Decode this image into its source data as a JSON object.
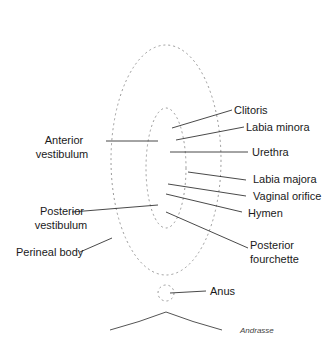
{
  "diagram": {
    "type": "labeled anatomical line drawing",
    "labels_right": [
      {
        "text": "Clitoris"
      },
      {
        "text": "Labia minora"
      },
      {
        "text": "Urethra"
      },
      {
        "text": "Labia majora"
      },
      {
        "text": "Vaginal orifice"
      },
      {
        "text": "Hymen"
      },
      {
        "text": "Posterior",
        "text2": "fourchette"
      },
      {
        "text": "Anus"
      }
    ],
    "labels_left": [
      {
        "text": "Anterior",
        "text2": "vestibulum"
      },
      {
        "text": "Posterior",
        "text2": "vestibulum"
      },
      {
        "text": "Perineal body"
      }
    ],
    "signature": "Andrasse"
  }
}
